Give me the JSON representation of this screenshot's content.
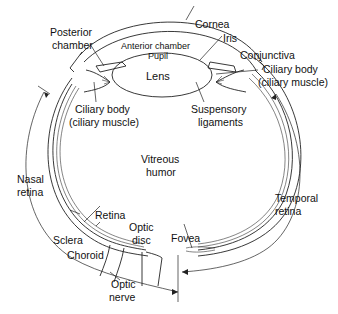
{
  "diagram": {
    "labels": {
      "posterior_chamber": [
        "Posterior",
        "chamber"
      ],
      "anterior_chamber": "Anterior chamber",
      "pupil": "Pupil",
      "lens": "Lens",
      "cornea": "Cornea",
      "iris": "Iris",
      "conjunctiva": "Conjunctiva",
      "ciliary_body_right": [
        "Ciliary body",
        "(ciliary muscle)"
      ],
      "ciliary_body_left": [
        "Ciliary body",
        "(ciliary muscle)"
      ],
      "suspensory_ligaments": [
        "Suspensory",
        "ligaments"
      ],
      "vitreous_humor": [
        "Vitreous",
        "humor"
      ],
      "nasal_retina": [
        "Nasal",
        "retina"
      ],
      "temporal_retina": [
        "Temporal",
        "retina"
      ],
      "retina": "Retina",
      "sclera": "Sclera",
      "choroid": "Choroid",
      "optic_disc": [
        "Optic",
        "disc"
      ],
      "fovea": "Fovea",
      "optic_nerve": [
        "Optic",
        "nerve"
      ]
    },
    "colors": {
      "line": "#222222",
      "background": "#ffffff"
    }
  }
}
